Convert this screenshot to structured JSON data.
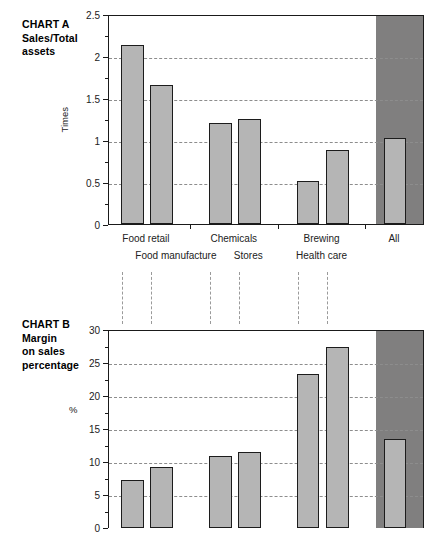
{
  "figure": {
    "background": "#ffffff",
    "bar_fill": "#b5b5b5",
    "bar_edge": "#1c1c1c",
    "all_panel_fill": "#807f7f",
    "grid_color": "#8d8d8d"
  },
  "chart_a": {
    "title": "CHART A\nSales/Total\nassets",
    "unit": "Times",
    "yticks": [
      "0",
      "0.5",
      "1",
      "1.5",
      "2",
      "2.5"
    ],
    "xlabels_top": [
      "Food retail",
      "Chemicals",
      "Brewing",
      "All"
    ],
    "xlabels_bottom": [
      "Food manufacture",
      "Stores",
      "Health care"
    ]
  },
  "chart_b": {
    "title": "CHART B\nMargin\non sales\npercentage",
    "unit": "%",
    "yticks": [
      "0",
      "5",
      "10",
      "15",
      "20",
      "25",
      "30"
    ]
  },
  "chart_data": [
    {
      "type": "bar",
      "title": "CHART A Sales/Total assets",
      "xlabel": "",
      "ylabel": "Times",
      "ylim": [
        0,
        2.5
      ],
      "yticks": [
        0,
        0.5,
        1,
        1.5,
        2,
        2.5
      ],
      "grid": true,
      "legend": "none",
      "categories": [
        "Food retail",
        "Food manufacture",
        "Chemicals",
        "Stores",
        "Brewing",
        "Health care",
        "All"
      ],
      "values": [
        2.13,
        1.65,
        1.2,
        1.25,
        0.51,
        0.88,
        1.02
      ],
      "highlighted_category": "All",
      "annotations": [
        "Dark grey panel highlights the 'All' column"
      ]
    },
    {
      "type": "bar",
      "title": "CHART B Margin on sales percentage",
      "xlabel": "",
      "ylabel": "%",
      "ylim": [
        0,
        30
      ],
      "yticks": [
        0,
        5,
        10,
        15,
        20,
        25,
        30
      ],
      "grid": true,
      "legend": "none",
      "categories": [
        "Food retail",
        "Food manufacture",
        "Chemicals",
        "Stores",
        "Brewing",
        "Health care",
        "All"
      ],
      "values": [
        7.3,
        9.3,
        10.9,
        11.5,
        23.3,
        27.4,
        13.5
      ],
      "highlighted_category": "All",
      "annotations": [
        "Dark grey panel highlights the 'All' column",
        "Category labels are shared with Chart A via dashed connector lines"
      ]
    }
  ]
}
